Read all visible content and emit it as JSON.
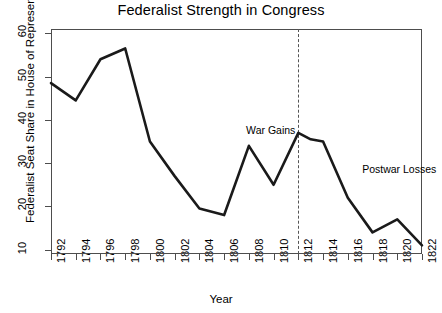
{
  "chart_data": {
    "type": "line",
    "title": "Federalist Strength in Congress",
    "xlabel": "Year",
    "ylabel": "Federalist Seat Share in House of Representatives",
    "xlim": [
      1792,
      1822
    ],
    "ylim": [
      9,
      61
    ],
    "grid": false,
    "legend": null,
    "x_ticks": [
      1792,
      1794,
      1796,
      1798,
      1800,
      1802,
      1804,
      1806,
      1808,
      1810,
      1812,
      1814,
      1816,
      1818,
      1820,
      1822
    ],
    "x_tick_labels": [
      "1792",
      "1794",
      "1796",
      "1798",
      "1800",
      "1802",
      "1804",
      "1806",
      "1808",
      "1810",
      "1812",
      "1814",
      "1816",
      "1818",
      "1820",
      "1822"
    ],
    "y_ticks": [
      10,
      20,
      30,
      40,
      50,
      60
    ],
    "y_tick_labels": [
      "10",
      "20",
      "30",
      "40",
      "50",
      "60"
    ],
    "line_color": "#1a1a1a",
    "line_width": 2.6,
    "x": [
      1792,
      1794,
      1796,
      1798,
      1800,
      1802,
      1804,
      1806,
      1808,
      1810,
      1812,
      1813,
      1814,
      1816,
      1818,
      1820,
      1822
    ],
    "values": [
      48.5,
      44.5,
      54.0,
      56.5,
      35.0,
      27.0,
      19.5,
      18.0,
      34.0,
      25.0,
      37.0,
      35.5,
      35.0,
      22.0,
      14.0,
      17.0,
      11.0
    ],
    "series": [
      {
        "name": "Federalist Seat Share",
        "values": [
          48.5,
          44.5,
          54.0,
          56.5,
          35.0,
          27.0,
          19.5,
          18.0,
          34.0,
          25.0,
          37.0,
          35.5,
          35.0,
          22.0,
          14.0,
          17.0,
          11.0
        ]
      }
    ],
    "vertical_reference_lines": [
      {
        "x": 1812,
        "style": "dashed",
        "color": "#555555",
        "label": "War Gains"
      }
    ],
    "annotations": [
      {
        "text": "War Gains",
        "x": 1812,
        "y": 37.5,
        "align": "right"
      },
      {
        "text": "Postwar Losses",
        "x": 1817,
        "y": 28.5,
        "align": "left"
      }
    ]
  }
}
